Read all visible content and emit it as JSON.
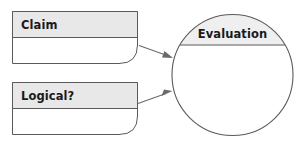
{
  "diagram": {
    "type": "flow-diagram",
    "background_color": "#ffffff",
    "stroke_color": "#5a5a5a",
    "header_fill_color": "#e8e8e8",
    "body_fill_color": "#ffffff",
    "text_color": "#1a1a1a",
    "connector_color": "#6a6a6a",
    "nodes": [
      {
        "id": "claim",
        "shape": "rounded-corner-box",
        "label": "Claim",
        "body_text": ""
      },
      {
        "id": "logical",
        "shape": "rounded-corner-box",
        "label": "Logical?",
        "body_text": ""
      },
      {
        "id": "evaluation",
        "shape": "circle",
        "label": "Evaluation",
        "body_text": ""
      }
    ],
    "connectors": [
      {
        "id": "claim-to-evaluation",
        "from": "claim",
        "to": "evaluation",
        "style": "arrow"
      },
      {
        "id": "logical-to-evaluation",
        "from": "logical",
        "to": "evaluation",
        "style": "arrow"
      }
    ]
  }
}
